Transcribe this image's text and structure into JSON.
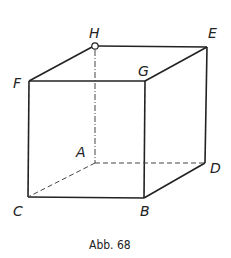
{
  "figure": {
    "caption": "Abb. 68",
    "shape": "cube",
    "vertices": {
      "A": {
        "label": "A",
        "x": 95,
        "y": 163,
        "hidden": true
      },
      "B": {
        "label": "B",
        "x": 144,
        "y": 198
      },
      "C": {
        "label": "C",
        "x": 28,
        "y": 197
      },
      "D": {
        "label": "D",
        "x": 205,
        "y": 163
      },
      "E": {
        "label": "E",
        "x": 207,
        "y": 47
      },
      "F": {
        "label": "F",
        "x": 29,
        "y": 81
      },
      "G": {
        "label": "G",
        "x": 145,
        "y": 81
      },
      "H": {
        "label": "H",
        "x": 95,
        "y": 46,
        "marked": "open-circle"
      }
    },
    "visible_edges": [
      "FG",
      "GE",
      "EH",
      "HF",
      "FC",
      "CB",
      "BG",
      "BD",
      "DE"
    ],
    "hidden_edges": [
      "HA",
      "AC",
      "AD"
    ],
    "line_color": "#222222"
  }
}
